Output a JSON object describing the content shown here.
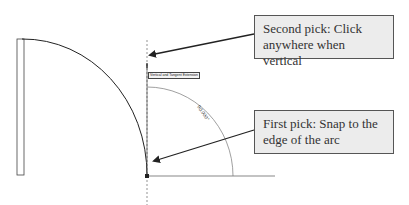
{
  "diagram": {
    "tooltip": "Vertical and Tangent Extension",
    "angle_label": "90.000°",
    "callouts": {
      "second_pick": "Second pick: Click anywhere when vertical",
      "first_pick": "First pick: Snap to the edge of the arc"
    },
    "colors": {
      "line": "#222222",
      "dim_line": "#777777",
      "callout_bg": "#ececec",
      "callout_border": "#555555"
    }
  }
}
